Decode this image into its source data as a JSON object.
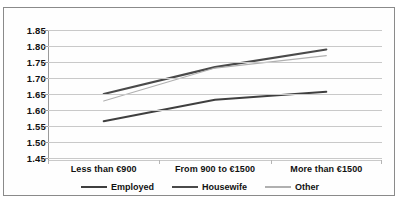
{
  "chart_data": {
    "type": "line",
    "title": "",
    "subtitle": "",
    "xlabel": "",
    "ylabel": "",
    "categories": [
      "Less than €900",
      "From 900 to €1500",
      "More than €1500"
    ],
    "series": [
      {
        "name": "Employed",
        "values": [
          1.565,
          1.632,
          1.657
        ],
        "color": "#3f3f3f"
      },
      {
        "name": "Housewife",
        "values": [
          1.65,
          1.734,
          1.789
        ],
        "color": "#4a4a4a"
      },
      {
        "name": "Other",
        "values": [
          1.628,
          1.731,
          1.77
        ],
        "color": "#b0b0b0"
      }
    ],
    "ylim": [
      1.45,
      1.85
    ],
    "ytick_step": 0.05,
    "yticks": [
      "1.85",
      "1.80",
      "1.75",
      "1.70",
      "1.65",
      "1.60",
      "1.55",
      "1.50",
      "1.45"
    ],
    "grid": true,
    "grid_axis": "y",
    "legend_position": "bottom",
    "markers": false
  },
  "legend": {
    "items": [
      {
        "label": "Employed"
      },
      {
        "label": "Housewife"
      },
      {
        "label": "Other"
      }
    ]
  },
  "colors": {
    "grid": "#c9c9c9",
    "axis": "#9a9a9a",
    "border": "#8a8a8a",
    "background": "#ffffff",
    "text": "#111111"
  }
}
